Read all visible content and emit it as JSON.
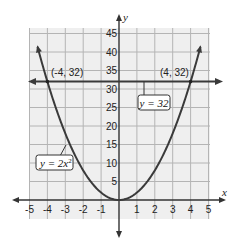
{
  "chart_data": {
    "type": "line",
    "title": "",
    "xlabel": "x",
    "ylabel": "y",
    "xlim": [
      -5,
      5
    ],
    "ylim": [
      0,
      45
    ],
    "x_ticks": [
      -5,
      -4,
      -3,
      -2,
      -1,
      1,
      2,
      3,
      4,
      5
    ],
    "y_ticks": [
      5,
      10,
      15,
      20,
      25,
      30,
      35,
      40,
      45
    ],
    "grid": true,
    "series": [
      {
        "name": "y = 2x²",
        "label_main": "y = 2x",
        "label_sup": "2",
        "function": "2*x^2",
        "x": [
          -4.5,
          -4,
          -3,
          -2,
          -1,
          0,
          1,
          2,
          3,
          4,
          4.5
        ],
        "values": [
          40.5,
          32,
          18,
          8,
          2,
          0,
          2,
          8,
          18,
          32,
          40.5
        ],
        "color": "#3a3a3a"
      },
      {
        "name": "y = 32",
        "label": "y = 32",
        "function": "32",
        "x": [
          -5,
          5
        ],
        "values": [
          32,
          32
        ],
        "color": "#3a3a3a"
      }
    ],
    "annotations": [
      {
        "text": "(-4, 32)",
        "x": -4,
        "y": 32
      },
      {
        "text": "(4, 32)",
        "x": 4,
        "y": 32
      }
    ]
  },
  "colors": {
    "grid_bg": "#efefef",
    "grid_line": "#b4b4b4",
    "axis": "#333333",
    "curve": "#3a3a3a"
  }
}
